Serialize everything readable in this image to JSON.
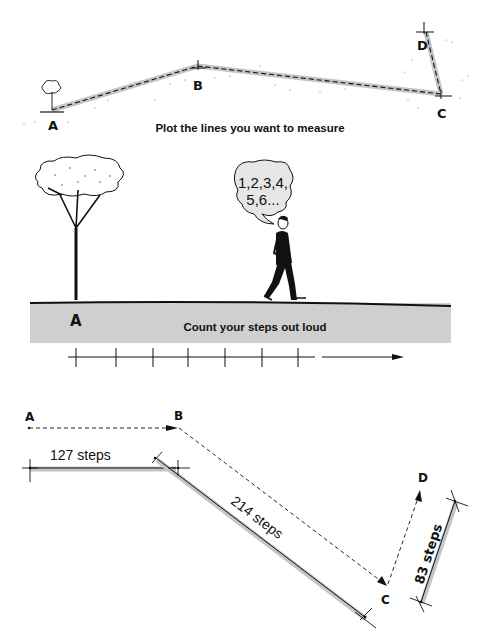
{
  "panel_top": {
    "caption": "Plot the lines you want to measure",
    "points": [
      {
        "label": "A",
        "x": 52,
        "y": 110
      },
      {
        "label": "B",
        "x": 198,
        "y": 66
      },
      {
        "label": "C",
        "x": 441,
        "y": 94
      },
      {
        "label": "D",
        "x": 424,
        "y": 30
      }
    ]
  },
  "panel_middle": {
    "caption": "Count your steps out loud",
    "start_label": "A",
    "speech_line1": "1,2,3,4,",
    "speech_line2": "5,6..."
  },
  "panel_bottom": {
    "labels": {
      "a": "A",
      "b": "B",
      "c": "C",
      "d": "D"
    },
    "segments": [
      {
        "from": "A",
        "to": "B",
        "label": "127 steps"
      },
      {
        "from": "B",
        "to": "C",
        "label": "214 steps"
      },
      {
        "from": "C",
        "to": "D",
        "label": "83 steps"
      }
    ]
  },
  "colors": {
    "ink": "#111111",
    "ground": "#cfcfcf",
    "path_shadow": "#bdbdbd"
  }
}
